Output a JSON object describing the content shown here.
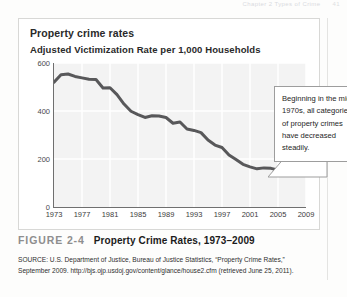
{
  "running_head": {
    "text": "Chapter 2  Types of Crime",
    "page_number": "41"
  },
  "figure": {
    "chart_title": "Property crime rates",
    "chart_subtitle": "Adjusted Victimization Rate per 1,000 Households",
    "figure_number": "FIGURE 2-4",
    "caption": "Property Crime Rates, 1973–2009",
    "source": "SOURCE: U.S. Department of Justice, Bureau of Justice Statistics, “Property Crime Rates,” September 2009. http://bjs.ojp.usdoj.gov/content/glance/house2.cfm (retrieved June 25, 2011).",
    "callout": "Beginning in the mid-1970s, all categories of property crimes have decreased steadily."
  },
  "colors": {
    "line": "#58585a",
    "plot_background": "#f3f3f3",
    "gridline": "#ffffff",
    "axis": "#6f6f6f",
    "frame": "#d8d8d6",
    "figure_number": "#8e8e8e"
  },
  "chart_data": {
    "type": "line",
    "title": "Property crime rates",
    "subtitle": "Adjusted Victimization Rate per 1,000 Households",
    "xlabel": "",
    "ylabel": "Adjusted Victimization Rate per 1,000 Households",
    "xlim": [
      1973,
      2009
    ],
    "ylim": [
      0,
      600
    ],
    "yticks": [
      0,
      200,
      400,
      600
    ],
    "xticks": [
      1973,
      1977,
      1981,
      1985,
      1989,
      1993,
      1997,
      2001,
      2005,
      2009
    ],
    "grid": true,
    "legend": false,
    "series": [
      {
        "name": "Property crime rate per 1,000 households",
        "x": [
          1973,
          1974,
          1975,
          1976,
          1977,
          1978,
          1979,
          1980,
          1981,
          1982,
          1983,
          1984,
          1985,
          1986,
          1987,
          1988,
          1989,
          1990,
          1991,
          1992,
          1993,
          1994,
          1995,
          1996,
          1997,
          1998,
          1999,
          2000,
          2001,
          2002,
          2003,
          2004,
          2005,
          2006,
          2007,
          2008,
          2009
        ],
        "values": [
          520,
          551,
          554,
          544,
          538,
          532,
          531,
          496,
          497,
          468,
          429,
          399,
          385,
          373,
          380,
          379,
          373,
          349,
          354,
          325,
          319,
          310,
          279,
          258,
          248,
          217,
          198,
          178,
          167,
          159,
          163,
          161,
          154,
          169,
          147,
          141,
          133
        ]
      }
    ]
  }
}
